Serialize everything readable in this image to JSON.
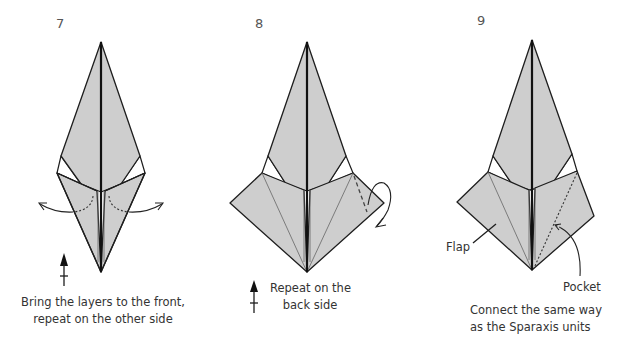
{
  "steps": [
    {
      "number": "7",
      "caption_line1": "Bring the layers to the front,",
      "caption_line2": "repeat on the other side",
      "symbol": "turn-over-arrow-icon"
    },
    {
      "number": "8",
      "caption_line1": "Repeat on the",
      "caption_line2": "back side",
      "symbol": "turn-over-arrow-icon"
    },
    {
      "number": "9",
      "caption_line1": "Connect the same way",
      "caption_line2": "as the Sparaxis units",
      "labels": {
        "flap": "Flap",
        "pocket": "Pocket"
      }
    }
  ],
  "colors": {
    "paper_fill": "#cecece",
    "outline": "#1e1e1e",
    "background": "#ffffff",
    "text": "#333333"
  }
}
